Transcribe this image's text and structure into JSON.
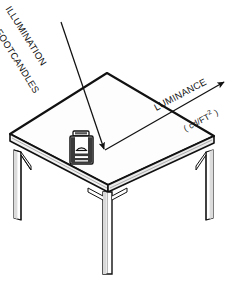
{
  "figure": {
    "background_color": "#ffffff",
    "line_color": "#111111",
    "surface_color": "#fdfdfd",
    "edge_shade_color": "#e9e9e9",
    "leg_shade_color": "#d9d9d9",
    "width": 235,
    "height": 281
  },
  "labels": {
    "illumination": "ILLUMINATION",
    "footcandles": "FOOTCANDLES",
    "luminance": "LUMINANCE",
    "units_open": "( cd/FT",
    "units_exponent": "2",
    "units_close": " )"
  },
  "arrows": {
    "incident": {
      "name": "illumination-arrow",
      "from_x": 61,
      "from_y": 22,
      "to_x": 105,
      "to_y": 150,
      "direction": "down-right",
      "meaning": "incident light falling on the table"
    },
    "reflected": {
      "name": "luminance-arrow",
      "from_x": 105,
      "from_y": 150,
      "to_x": 226,
      "to_y": 81,
      "direction": "up-right",
      "meaning": "light reflected from the table toward the eye"
    }
  },
  "table": {
    "name": "table",
    "top_corners": {
      "left_x": 10,
      "left_y": 134,
      "top_x": 107,
      "top_y": 73,
      "right_x": 214,
      "right_y": 136,
      "bottom_x": 108,
      "bottom_y": 185
    },
    "edge_thickness": 7,
    "legs": [
      {
        "name": "leg-left",
        "x": 14,
        "y": 150,
        "height": 68,
        "width": 7
      },
      {
        "name": "leg-front",
        "x": 104,
        "y": 194,
        "height": 80,
        "width": 8
      },
      {
        "name": "leg-right",
        "x": 206,
        "y": 152,
        "height": 68,
        "width": 7
      }
    ]
  },
  "object": {
    "name": "can-on-table",
    "x": 70,
    "y": 131,
    "width": 24,
    "height": 33,
    "description": "small can with lid and arched label on the table top"
  }
}
